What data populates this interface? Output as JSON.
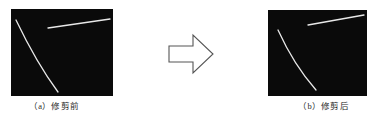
{
  "figure": {
    "background_color": "#ffffff",
    "panel_background_color": "#0a0a0a",
    "stroke_color": "#e8e8e8",
    "arrow_outline_color": "#555555",
    "arrow_fill_color": "#ffffff"
  },
  "panels": [
    {
      "id": "before",
      "caption": "（a）修剪前",
      "label": "(a)",
      "title": "修剪前",
      "curve_label": "curve-stroke",
      "line_label": "straight-stroke"
    },
    {
      "id": "after",
      "caption": "（b）修剪后",
      "label": "(b)",
      "title": "修剪后",
      "curve_label": "curve-stroke",
      "line_label": "straight-stroke"
    }
  ],
  "arrow": {
    "name": "right-arrow-icon",
    "direction": "right"
  }
}
